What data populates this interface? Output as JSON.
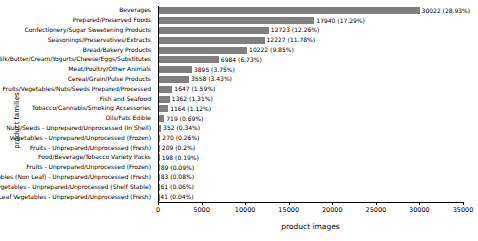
{
  "chart_data": {
    "type": "bar",
    "orientation": "horizontal",
    "title": "",
    "xlabel": "product images",
    "ylabel": "product families",
    "xlim": [
      0,
      35000
    ],
    "xticks": [
      0,
      5000,
      10000,
      15000,
      20000,
      25000,
      30000,
      35000
    ],
    "xticklabels": [
      "0",
      "5000",
      "10000",
      "15000",
      "20000",
      "25000",
      "30000",
      "35000"
    ],
    "grid": false,
    "legend": false,
    "bar_color": "#808080",
    "categories": [
      "Beverages",
      "Prepared/Preserved Foods",
      "Confectionery/Sugar Sweetening Products",
      "Seasonings/Preservatives/Extracts",
      "Bread/Bakery Products",
      "Milk/Butter/Cream/Yogurts/Cheese/Eggs/Substitutes",
      "Meat/Poultry/Other Animals",
      "Cereal/Grain/Pulse Products",
      "Fruits/Vegetables/Nuts/Seeds Prepared/Processed",
      "Fish and Seafood",
      "Tobacco/Cannabis/Smoking Accessories",
      "Oils/Fats Edible",
      "Nuts/Seeds - Unprepared/Unprocessed (In Shell)",
      "Vegetables - Unprepared/Unprocessed (Frozen)",
      "Fruits - Unprepared/Unprocessed (Fresh)",
      "Food/Beverage/Tobacco Variety Packs",
      "Fruits - Unprepared/Unprocessed (Frozen)",
      "Vegetables (Non Leaf) - Unprepared/Unprocessed (Fresh)",
      "Vegetables - Unprepared/Unprocessed (Shelf Stable)",
      "Leaf Vegetables - Unprepared/Unprocessed (Fresh)"
    ],
    "values": [
      30022,
      17940,
      12723,
      12227,
      10222,
      6984,
      3895,
      3558,
      1647,
      1362,
      1164,
      719,
      352,
      270,
      209,
      198,
      89,
      83,
      61,
      41
    ],
    "percents": [
      "28.93%",
      "17.29%",
      "12.26%",
      "11.78%",
      "9.85%",
      "6.73%",
      "3.75%",
      "3.43%",
      "1.59%",
      "1.31%",
      "1.12%",
      "0.69%",
      "0.34%",
      "0.26%",
      "0.2%",
      "0.19%",
      "0.09%",
      "0.08%",
      "0.06%",
      "0.04%"
    ],
    "bar_labels": [
      "30022 (28.93%)",
      "17940 (17.29%)",
      "12723 (12.26%)",
      "12227 (11.78%)",
      "10222 (9.85%)",
      "6984 (6.73%)",
      "3895 (3.75%)",
      "3558 (3.43%)",
      "1647 (1.59%)",
      "1362 (1.31%)",
      "1164 (1.12%)",
      "719 (0.69%)",
      "352 (0.34%)",
      "270 (0.26%)",
      "209 (0.2%)",
      "198 (0.19%)",
      "89 (0.09%)",
      "83 (0.08%)",
      "61 (0.06%)",
      "41 (0.04%)"
    ]
  }
}
